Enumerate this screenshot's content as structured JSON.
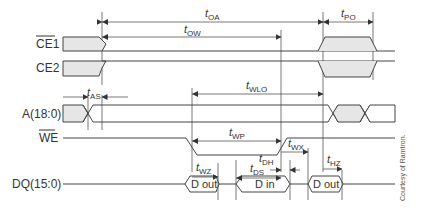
{
  "diagram": {
    "type": "timing-diagram",
    "signals": [
      {
        "id": "ce1",
        "label": "CE1",
        "overbar": true
      },
      {
        "id": "ce2",
        "label": "CE2",
        "overbar": false
      },
      {
        "id": "addr",
        "label": "A(18:0)",
        "overbar": false
      },
      {
        "id": "we",
        "label": "WE",
        "overbar": true
      },
      {
        "id": "dq",
        "label": "DQ(15:0)",
        "overbar": false
      }
    ],
    "timings": {
      "t_oa": {
        "base": "t",
        "sub": "OA"
      },
      "t_ow": {
        "base": "t",
        "sub": "OW"
      },
      "t_po": {
        "base": "t",
        "sub": "PO"
      },
      "t_as": {
        "base": "t",
        "sub": "AS"
      },
      "t_wlo": {
        "base": "t",
        "sub": "WLO"
      },
      "t_wp": {
        "base": "t",
        "sub": "WP"
      },
      "t_wx": {
        "base": "t",
        "sub": "WX"
      },
      "t_wz": {
        "base": "t",
        "sub": "WZ"
      },
      "t_dh": {
        "base": "t",
        "sub": "DH"
      },
      "t_ds": {
        "base": "t",
        "sub": "DS"
      },
      "t_hz": {
        "base": "t",
        "sub": "HZ"
      }
    },
    "data_boxes": [
      {
        "id": "dout1",
        "label": "D out"
      },
      {
        "id": "din",
        "label": "D in"
      },
      {
        "id": "dout2",
        "label": "D out"
      }
    ],
    "credit": "Courtesy of Ramtron."
  }
}
